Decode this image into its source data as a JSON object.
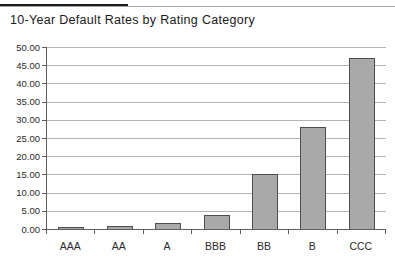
{
  "header": {
    "title": "10-Year Default Rates by Rating Category"
  },
  "chart_data": {
    "type": "bar",
    "title": "10-Year Default Rates by Rating Category",
    "categories": [
      "AAA",
      "AA",
      "A",
      "BBB",
      "BB",
      "B",
      "CCC"
    ],
    "values": [
      0.5,
      0.9,
      1.6,
      3.8,
      15.0,
      28.0,
      47.0
    ],
    "xlabel": "",
    "ylabel": "",
    "ylim": [
      0,
      50
    ],
    "ytick_step": 5,
    "ytick_decimals": 2,
    "grid": true,
    "legend_position": "none",
    "colors": {
      "bar_fill": "#a9a9a9",
      "bar_border": "#4d4d4d",
      "gridline": "#b3b3b3",
      "axis": "#5e5e5e",
      "text": "#2b2b2b"
    }
  }
}
